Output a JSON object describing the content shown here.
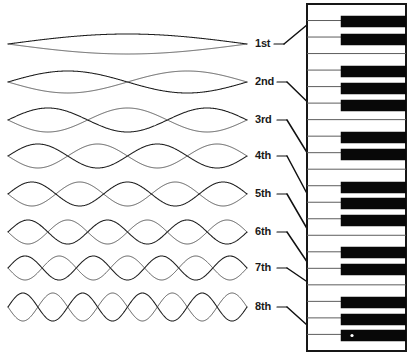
{
  "figure": {
    "background_color": "#ffffff",
    "ink_color": "#1a1a1a",
    "width": 410,
    "height": 355
  },
  "harmonics": [
    {
      "label": "1st",
      "order": 1,
      "lobes": 1,
      "label_x": 255,
      "label_y": 44,
      "wave_y": 44,
      "amplitude": 10,
      "x_start": 8,
      "x_end": 247
    },
    {
      "label": "2nd",
      "order": 2,
      "lobes": 2,
      "label_x": 255,
      "label_y": 82,
      "wave_y": 82,
      "amplitude": 11,
      "x_start": 8,
      "x_end": 247
    },
    {
      "label": "3rd",
      "order": 3,
      "lobes": 3,
      "label_x": 255,
      "label_y": 120,
      "wave_y": 120,
      "amplitude": 12,
      "x_start": 8,
      "x_end": 247
    },
    {
      "label": "4th",
      "order": 4,
      "lobes": 4,
      "label_x": 255,
      "label_y": 156,
      "wave_y": 156,
      "amplitude": 12,
      "x_start": 8,
      "x_end": 247
    },
    {
      "label": "5th",
      "order": 5,
      "lobes": 5,
      "label_x": 255,
      "label_y": 194,
      "wave_y": 194,
      "amplitude": 12,
      "x_start": 8,
      "x_end": 247
    },
    {
      "label": "6th",
      "order": 6,
      "lobes": 6,
      "label_x": 255,
      "label_y": 232,
      "wave_y": 232,
      "amplitude": 12,
      "x_start": 8,
      "x_end": 247
    },
    {
      "label": "7th",
      "order": 7,
      "lobes": 7,
      "label_x": 255,
      "label_y": 268,
      "wave_y": 268,
      "amplitude": 12,
      "x_start": 8,
      "x_end": 247
    },
    {
      "label": "8th",
      "order": 8,
      "lobes": 8,
      "label_x": 255,
      "label_y": 307,
      "wave_y": 307,
      "amplitude": 14,
      "x_start": 8,
      "x_end": 247
    }
  ],
  "leaders": [
    {
      "from_label": "1st",
      "stub_x1": 274,
      "stub_y1": 44,
      "x1": 284,
      "y1": 44,
      "x2": 325,
      "y2": 10,
      "dot_x": 325,
      "dot_y": 10
    },
    {
      "from_label": "2nd",
      "stub_x1": 277,
      "stub_y1": 82,
      "x1": 287,
      "y1": 82,
      "x2": 326,
      "y2": 120,
      "dot_x": 326,
      "dot_y": 120
    },
    {
      "from_label": "3rd",
      "stub_x1": 277,
      "stub_y1": 120,
      "x1": 287,
      "y1": 120,
      "x2": 327,
      "y2": 185,
      "dot_x": 327,
      "dot_y": 185
    },
    {
      "from_label": "4th",
      "stub_x1": 277,
      "stub_y1": 156,
      "x1": 287,
      "y1": 156,
      "x2": 327,
      "y2": 231,
      "dot_x": 327,
      "dot_y": 231
    },
    {
      "from_label": "5th",
      "stub_x1": 277,
      "stub_y1": 194,
      "x1": 287,
      "y1": 194,
      "x2": 327,
      "y2": 263,
      "dot_x": 327,
      "dot_y": 263
    },
    {
      "from_label": "6th",
      "stub_x1": 277,
      "stub_y1": 232,
      "x1": 287,
      "y1": 232,
      "x2": 328,
      "y2": 293,
      "dot_x": 328,
      "dot_y": 293
    },
    {
      "from_label": "7th",
      "stub_x1": 277,
      "stub_y1": 268,
      "x1": 287,
      "y1": 268,
      "x2": 356,
      "y2": 315,
      "dot_x": 356,
      "dot_y": 315
    },
    {
      "from_label": "8th",
      "stub_x1": 277,
      "stub_y1": 307,
      "x1": 287,
      "y1": 307,
      "x2": 327,
      "y2": 343,
      "dot_x": 327,
      "dot_y": 343
    }
  ],
  "keyboard": {
    "frame": {
      "x": 307,
      "y": 4,
      "width": 99,
      "height": 347
    },
    "white_key_count": 21,
    "white_key_height": 16.52,
    "black_key": {
      "x": 341,
      "width": 65,
      "height": 11
    },
    "black_key_offsets": [
      12,
      30,
      62,
      79,
      96,
      128,
      145,
      178,
      194,
      211,
      243,
      260,
      293,
      310,
      326
    ],
    "black_key_groups": [
      2,
      3,
      2,
      3,
      2,
      3
    ],
    "marked_key_y": 326,
    "marked_key_dot_x": 352
  }
}
